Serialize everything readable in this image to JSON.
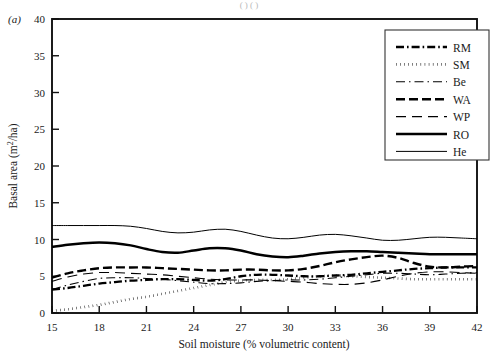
{
  "figure": {
    "panel_label": "(a)",
    "top_fragment": "( ) ( )"
  },
  "chart_data": {
    "type": "line",
    "title": "",
    "xlabel": "Soil moisture (% volumetric content)",
    "ylabel": "Basal area (m2/ha)",
    "ylabel_display": "Basal area (m²/ha)",
    "xlim": [
      15,
      42
    ],
    "ylim": [
      0,
      40
    ],
    "xticks": [
      15,
      18,
      21,
      24,
      27,
      30,
      33,
      36,
      39,
      42
    ],
    "yticks": [
      0,
      5,
      10,
      15,
      20,
      25,
      30,
      35,
      40
    ],
    "xticklabels": [
      "15",
      "18",
      "21",
      "24",
      "27",
      "30",
      "33",
      "36",
      "39",
      "42"
    ],
    "yticklabels": [
      "0",
      "5",
      "10",
      "15",
      "20",
      "25",
      "30",
      "35",
      "40"
    ],
    "grid": false,
    "legend_position": "upper-right",
    "x": [
      15,
      16,
      17,
      18,
      19,
      20,
      21,
      22,
      23,
      24,
      25,
      26,
      27,
      28,
      29,
      30,
      31,
      32,
      33,
      34,
      35,
      36,
      37,
      38,
      39,
      40,
      41,
      42
    ],
    "series": [
      {
        "name": "RM",
        "style": "dashdot-thick",
        "values": [
          3.2,
          3.4,
          3.7,
          4.0,
          4.2,
          4.4,
          4.5,
          4.6,
          4.6,
          4.5,
          4.4,
          4.6,
          5.0,
          5.2,
          5.2,
          5.1,
          5.0,
          5.0,
          5.1,
          5.2,
          5.4,
          5.6,
          5.8,
          6.0,
          6.1,
          6.2,
          6.2,
          6.2
        ]
      },
      {
        "name": "SM",
        "style": "dotted-thick",
        "values": [
          0.3,
          0.5,
          0.8,
          1.1,
          1.5,
          1.9,
          2.2,
          2.6,
          3.0,
          3.4,
          3.8,
          4.2,
          4.4,
          4.5,
          4.5,
          4.6,
          4.8,
          5.0,
          5.1,
          5.0,
          4.9,
          4.8,
          4.7,
          4.6,
          4.6,
          4.6,
          4.6,
          4.6
        ]
      },
      {
        "name": "Be",
        "style": "dashdot-thin",
        "values": [
          3.2,
          3.8,
          4.3,
          4.7,
          4.8,
          4.8,
          4.7,
          4.6,
          4.4,
          4.2,
          4.0,
          4.0,
          4.1,
          4.3,
          4.4,
          4.5,
          4.5,
          4.6,
          4.8,
          5.0,
          5.2,
          5.4,
          5.4,
          5.3,
          5.2,
          5.3,
          5.4,
          5.5
        ]
      },
      {
        "name": "WA",
        "style": "dashed-thick",
        "values": [
          4.8,
          5.4,
          5.8,
          6.1,
          6.2,
          6.2,
          6.2,
          6.1,
          6.0,
          5.9,
          5.8,
          5.8,
          5.9,
          5.9,
          5.8,
          5.8,
          6.0,
          6.4,
          6.9,
          7.3,
          7.6,
          7.8,
          7.5,
          6.8,
          6.3,
          6.2,
          6.3,
          6.4
        ]
      },
      {
        "name": "WP",
        "style": "dashed-thin-long",
        "values": [
          4.3,
          4.9,
          5.3,
          5.5,
          5.5,
          5.4,
          5.3,
          5.2,
          5.0,
          4.8,
          4.6,
          4.5,
          4.5,
          4.5,
          4.4,
          4.3,
          4.2,
          4.0,
          3.9,
          3.9,
          4.1,
          4.5,
          5.0,
          5.4,
          5.6,
          5.6,
          5.5,
          5.4
        ]
      },
      {
        "name": "RO",
        "style": "solid-thick",
        "values": [
          9.0,
          9.3,
          9.5,
          9.6,
          9.5,
          9.2,
          8.7,
          8.3,
          8.2,
          8.5,
          8.8,
          8.8,
          8.5,
          8.0,
          7.7,
          7.6,
          7.8,
          8.1,
          8.3,
          8.4,
          8.4,
          8.3,
          8.2,
          8.1,
          8.0,
          8.0,
          8.0,
          8.0
        ]
      },
      {
        "name": "He",
        "style": "solid-thin",
        "values": [
          11.9,
          11.9,
          11.9,
          11.9,
          11.9,
          11.8,
          11.5,
          11.1,
          10.9,
          11.0,
          11.3,
          11.4,
          11.1,
          10.6,
          10.2,
          10.1,
          10.3,
          10.6,
          10.7,
          10.5,
          10.2,
          9.9,
          9.9,
          10.1,
          10.3,
          10.3,
          10.2,
          10.1
        ]
      }
    ]
  },
  "legend": {
    "entries": [
      {
        "label": "RM",
        "style": "dashdot-thick"
      },
      {
        "label": "SM",
        "style": "dotted-thick"
      },
      {
        "label": "Be",
        "style": "dashdot-thin"
      },
      {
        "label": "WA",
        "style": "dashed-thick"
      },
      {
        "label": "WP",
        "style": "dashed-thin-long"
      },
      {
        "label": "RO",
        "style": "solid-thick"
      },
      {
        "label": "He",
        "style": "solid-thin"
      }
    ]
  }
}
